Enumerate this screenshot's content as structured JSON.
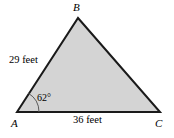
{
  "figure": {
    "type": "triangle-diagram",
    "colors": {
      "background": "#ffffff",
      "fill": "#d4d4d4",
      "stroke": "#1a1a1a",
      "arc": "#555555",
      "text": "#000000"
    },
    "vertices": [
      {
        "name": "A",
        "label": "A",
        "x": 17,
        "y": 112
      },
      {
        "name": "B",
        "label": "B",
        "x": 78,
        "y": 18
      },
      {
        "name": "C",
        "label": "C",
        "x": 160,
        "y": 112
      }
    ],
    "sides": [
      {
        "name": "AB",
        "label": "29 feet",
        "value": 29,
        "unit": "feet"
      },
      {
        "name": "AC",
        "label": "36 feet",
        "value": 36,
        "unit": "feet"
      }
    ],
    "angles": [
      {
        "at": "A",
        "label": "62°",
        "value": 62,
        "unit": "degrees"
      }
    ]
  }
}
